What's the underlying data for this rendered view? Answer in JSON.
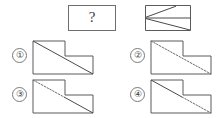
{
  "puzzle": {
    "type": "visual-reasoning-multiple-choice",
    "question_box": {
      "label": "?",
      "width": 48,
      "height": 26
    },
    "reference_figure": {
      "name": "rectangle-split-with-two-diagonals",
      "description": "Rectangle divided by a horizontal midline; upper half has a diagonal rising left-to-right stopping before the right edge, lower half has a diagonal falling left-to-right to the bottom-right corner",
      "outline": "M 0 0 L 46 0 L 46 26 L 0 26 Z",
      "midline": "M 0 13 L 46 13",
      "upper_diagonal": "M 1 12 L 31 1",
      "lower_diagonal": "M 1 14 L 45 25"
    },
    "options": [
      {
        "number": "①",
        "name": "option-1",
        "diagonal_style": "solid-solid",
        "description": "L-shaped polygon with one continuous solid diagonal from top-left to bottom-right",
        "outline": "M 1 1 L 33 1 L 33 16 L 61 16 L 61 34 L 1 34 Z",
        "segments": [
          {
            "path": "M 1 1 L 61 34",
            "style": "solid"
          }
        ]
      },
      {
        "number": "②",
        "name": "option-2",
        "diagonal_style": "dashed-dashed",
        "description": "L-shaped polygon with one continuous dashed diagonal from top-left to bottom-right",
        "outline": "M 1 1 L 33 1 L 33 16 L 61 16 L 61 34 L 1 34 Z",
        "segments": [
          {
            "path": "M 1 1 L 61 34",
            "style": "dashed"
          }
        ]
      },
      {
        "number": "③",
        "name": "option-3",
        "diagonal_style": "dashed-solid",
        "description": "L-shaped polygon; upper diagonal portion dashed, lower diagonal portion solid",
        "outline": "M 1 1 L 33 1 L 33 16 L 61 16 L 61 34 L 1 34 Z",
        "segments": [
          {
            "path": "M 1 1 L 32 18",
            "style": "dashed"
          },
          {
            "path": "M 32 18 L 61 34",
            "style": "solid"
          }
        ]
      },
      {
        "number": "④",
        "name": "option-4",
        "diagonal_style": "solid-dashed",
        "description": "L-shaped polygon; upper diagonal portion solid, lower diagonal portion dashed",
        "outline": "M 1 1 L 33 1 L 33 16 L 61 16 L 61 34 L 1 34 Z",
        "segments": [
          {
            "path": "M 1 1 L 32 18",
            "style": "solid"
          },
          {
            "path": "M 32 18 L 61 34",
            "style": "dashed"
          }
        ]
      }
    ],
    "colors": {
      "background": "#ffffff",
      "line": "#4a4a4a",
      "outline": "#5a5a5a",
      "dashed_line": "#6a6a6a",
      "box_border": "#6e6e6e",
      "text": "#3a3a3a"
    }
  }
}
